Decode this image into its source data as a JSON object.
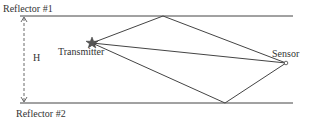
{
  "diagram": {
    "title": "",
    "labels": {
      "reflector_top": "Reflector #1",
      "reflector_bottom": "Reflector #2",
      "height": "H",
      "transmitter": "Transmitter",
      "sensor": "Sensor"
    },
    "colors": {
      "line": "#444444",
      "text": "#333333",
      "star": "#555555"
    },
    "nodes": {
      "transmitter": {
        "x": 92,
        "y": 43,
        "shape": "star"
      },
      "sensor": {
        "x": 286,
        "y": 63,
        "shape": "circle"
      },
      "top_reflection": {
        "x": 163,
        "y": 16
      },
      "bottom_reflection": {
        "x": 225,
        "y": 103
      }
    },
    "paths": [
      {
        "name": "direct",
        "from": "transmitter",
        "to": "sensor"
      },
      {
        "name": "via-reflector-1",
        "points": [
          "transmitter",
          "top_reflection",
          "sensor"
        ]
      },
      {
        "name": "via-reflector-2",
        "points": [
          "transmitter",
          "bottom_reflection",
          "sensor"
        ]
      }
    ]
  }
}
